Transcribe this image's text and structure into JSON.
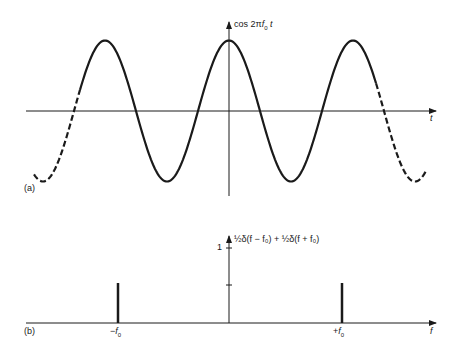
{
  "panel_a": {
    "tag": "(a)",
    "y_label_prefix": "cos 2π",
    "y_label_f": "f",
    "y_label_sub": "0",
    "y_label_t": " t",
    "x_label": "t",
    "function": "cos(2π f0 t)",
    "solid_range_note": "three cycles solid, ends dashed"
  },
  "panel_b": {
    "tag": "(b)",
    "y_label": "½δ(f − f₀) + ½δ(f + f₀)",
    "tick_one": "1",
    "x_label": "f",
    "neg_freq_label_sign": "−",
    "pos_freq_label_sign": "+",
    "freq_label_f": "f",
    "freq_label_sub": "0",
    "impulses": [
      {
        "position": "-f0",
        "weight": 0.5
      },
      {
        "position": "+f0",
        "weight": 0.5
      }
    ]
  },
  "colors": {
    "ink": "#1a1a1a",
    "background": "#ffffff"
  }
}
